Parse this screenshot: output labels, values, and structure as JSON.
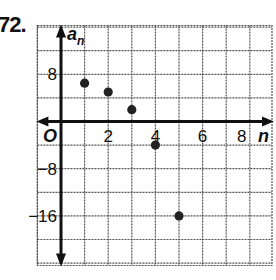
{
  "problem_number": "72.",
  "chart_data": {
    "type": "scatter",
    "title": "",
    "xlabel": "n",
    "ylabel": "a_n",
    "origin_label": "O",
    "x_ticks": [
      2,
      4,
      6,
      8
    ],
    "y_ticks": [
      8,
      -8,
      -16
    ],
    "x_tick_labels": [
      "2",
      "4",
      "6",
      "8"
    ],
    "y_tick_labels": [
      "8",
      "−8",
      "−16"
    ],
    "xlim": [
      -1,
      9
    ],
    "ylim": [
      -24,
      16
    ],
    "grid": true,
    "grid_step_x": 1,
    "grid_step_y": 4,
    "points": [
      {
        "n": 1,
        "a": 6.5
      },
      {
        "n": 2,
        "a": 5
      },
      {
        "n": 3,
        "a": 2
      },
      {
        "n": 4,
        "a": -4
      },
      {
        "n": 5,
        "a": -16
      }
    ],
    "x": [
      1,
      2,
      3,
      4,
      5
    ],
    "values": [
      6.5,
      5,
      2,
      -4,
      -16
    ]
  },
  "colors": {
    "ink": "#111111",
    "grid": "#555555",
    "background": "#ffffff"
  }
}
